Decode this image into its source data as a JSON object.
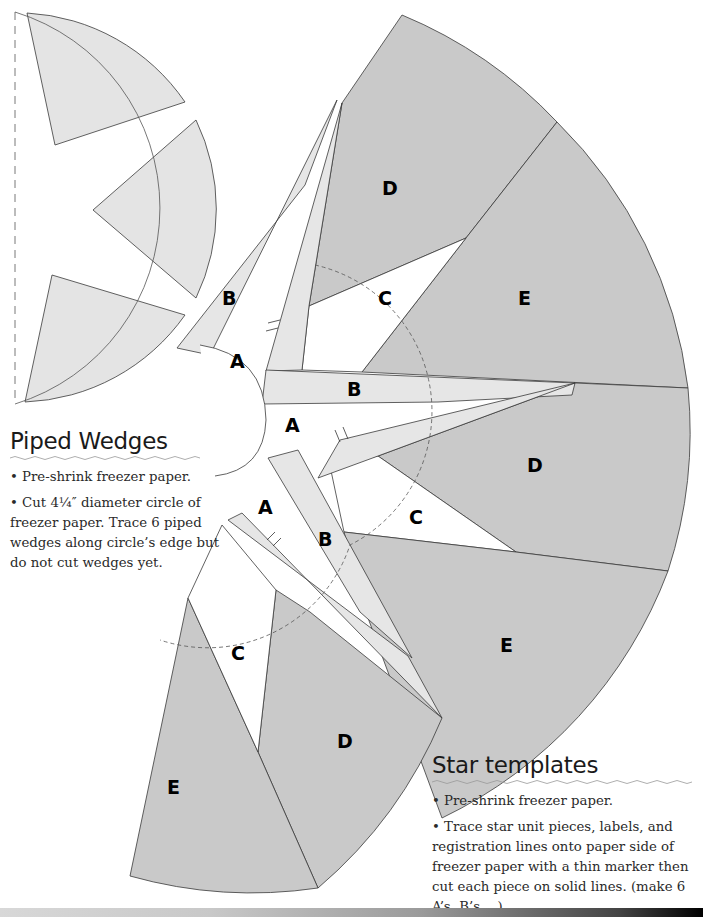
{
  "piped_wedges": {
    "title": "Piped Wedges",
    "bullets": [
      "• Pre-shrink freezer paper.",
      "• Cut 4¼″ diameter circle of freezer paper. Trace 6 piped wedges along circle’s edge but do not cut wedges yet."
    ]
  },
  "star_templates": {
    "title": "Star templates",
    "bullets": [
      "• Pre-shrink freezer paper.",
      "• Trace star unit pieces, labels, and registration lines onto paper side of freezer paper with a thin marker then cut each piece on solid lines. (make 6 A’s, B’s …)"
    ]
  },
  "template_labels": {
    "A1": "A",
    "A2": "A",
    "A3": "A",
    "B1": "B",
    "B2": "B",
    "B3": "B",
    "C1": "C",
    "C2": "C",
    "C3": "C",
    "D1": "D",
    "D2": "D",
    "D3": "D",
    "E1": "E",
    "E2": "E",
    "E3": "E"
  },
  "colors": {
    "dark_fill": "#c9c9c9",
    "light_fill": "#e6e6e6",
    "wedge_fill": "#e4e4e4",
    "outline": "#3a3a3a"
  }
}
